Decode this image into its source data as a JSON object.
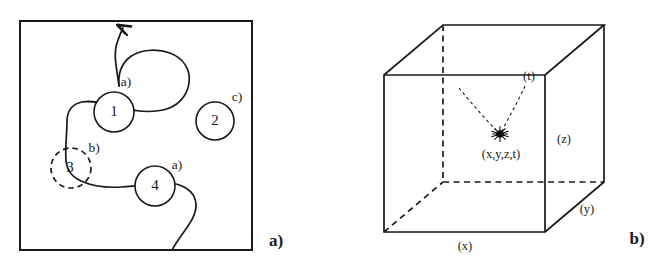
{
  "figure": {
    "type": "scientific-diagram",
    "background_color": "#ffffff",
    "ink_color": "#1a1a1a",
    "panels": [
      {
        "id": "panel-a",
        "caption": "a)",
        "caption_position": {
          "x": 276,
          "y": 246
        },
        "description": "Square field region containing a meandering particle track passing through numbered detector circles",
        "frame": {
          "x": 20,
          "y": 21,
          "width": 232,
          "height": 229
        },
        "nodes": [
          {
            "label": "1",
            "cx": 114,
            "cy": 112,
            "r": 20,
            "style": "solid",
            "note": "a)",
            "note_x": 126,
            "note_y": 86
          },
          {
            "label": "2",
            "cx": 215,
            "cy": 121,
            "r": 19,
            "style": "solid",
            "note": "c)",
            "note_x": 237,
            "note_y": 101
          },
          {
            "label": "3",
            "cx": 71,
            "cy": 168,
            "r": 20,
            "style": "dashed",
            "note": "b)",
            "note_x": 94,
            "note_y": 152
          },
          {
            "label": "4",
            "cx": 155,
            "cy": 186,
            "r": 20,
            "style": "solid",
            "note": "a)",
            "note_x": 177,
            "note_y": 169
          }
        ],
        "track": {
          "description": "continuous S-shaped trajectory with upward arrowhead at top border",
          "arrow_tip": {
            "x": 124,
            "y": 23
          },
          "enters_bottom_at": {
            "x": 172,
            "y": 250
          }
        }
      },
      {
        "id": "panel-b",
        "caption": "b)",
        "caption_position": {
          "x": 637,
          "y": 244
        },
        "description": "Wireframe cube representing a spatial volume with an event vertex inside",
        "cube": {
          "front_face": {
            "x": 384,
            "y": 75,
            "width": 161,
            "height": 157
          },
          "depth_offset": {
            "dx": 59,
            "dy": -50
          }
        },
        "event": {
          "marker": "star",
          "x": 500,
          "y": 134,
          "label": "(x,y,z,t)",
          "label_x": 501,
          "label_y": 154
        },
        "rays": [
          {
            "from": {
              "x": 459,
              "y": 88
            },
            "to": {
              "x": 500,
              "y": 134
            }
          },
          {
            "from": {
              "x": 525,
              "y": 86
            },
            "to": {
              "x": 500,
              "y": 134
            }
          }
        ],
        "axis_labels": [
          {
            "text": "(x)",
            "x": 465,
            "y": 249
          },
          {
            "text": "(y)",
            "x": 587,
            "y": 212
          },
          {
            "text": "(z)",
            "x": 563,
            "y": 141
          },
          {
            "text": "(t)",
            "x": 528,
            "y": 79
          }
        ]
      }
    ]
  }
}
